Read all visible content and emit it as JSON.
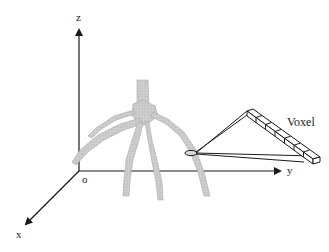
{
  "diagram": {
    "axes": {
      "z": {
        "label": "z"
      },
      "y": {
        "label": "y"
      },
      "x": {
        "label": "x"
      },
      "origin": {
        "label": "o"
      }
    },
    "callout": {
      "label": "Voxel",
      "voxel_count": 7
    },
    "colors": {
      "axis": "#1a1a1a",
      "root_fill": "#c8c8c8",
      "root_stroke": "#a8a8a8",
      "background": "#ffffff"
    }
  }
}
